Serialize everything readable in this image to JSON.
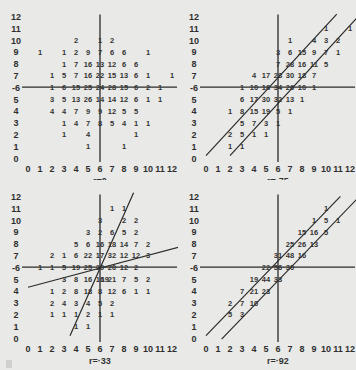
{
  "chart_data": [
    {
      "type": "table",
      "title": "r=0",
      "r_label": "r=0",
      "x_ticks": [
        0,
        1,
        2,
        3,
        4,
        5,
        6,
        7,
        8,
        9,
        10,
        11,
        12
      ],
      "y_ticks": [
        0,
        1,
        2,
        3,
        4,
        5,
        6,
        7,
        8,
        9,
        10,
        11,
        12
      ],
      "axis_cross": [
        6,
        6
      ],
      "regression_lines": [],
      "cells": [
        [
          10,
          4,
          2
        ],
        [
          10,
          6,
          1
        ],
        [
          10,
          7,
          2
        ],
        [
          9,
          1,
          1
        ],
        [
          9,
          3,
          1
        ],
        [
          9,
          4,
          2
        ],
        [
          9,
          5,
          9
        ],
        [
          9,
          6,
          7
        ],
        [
          9,
          7,
          6
        ],
        [
          9,
          8,
          6
        ],
        [
          9,
          10,
          1
        ],
        [
          8,
          3,
          1
        ],
        [
          8,
          4,
          7
        ],
        [
          8,
          5,
          16
        ],
        [
          8,
          6,
          13
        ],
        [
          8,
          7,
          12
        ],
        [
          8,
          8,
          6
        ],
        [
          8,
          9,
          6
        ],
        [
          7,
          2,
          1
        ],
        [
          7,
          3,
          5
        ],
        [
          7,
          4,
          7
        ],
        [
          7,
          5,
          16
        ],
        [
          7,
          6,
          22
        ],
        [
          7,
          7,
          15
        ],
        [
          7,
          8,
          13
        ],
        [
          7,
          9,
          6
        ],
        [
          7,
          10,
          1
        ],
        [
          7,
          12,
          1
        ],
        [
          6,
          2,
          1
        ],
        [
          6,
          3,
          6
        ],
        [
          6,
          4,
          15
        ],
        [
          6,
          5,
          25
        ],
        [
          6,
          6,
          24
        ],
        [
          6,
          7,
          28
        ],
        [
          6,
          8,
          15
        ],
        [
          6,
          9,
          6
        ],
        [
          6,
          10,
          2
        ],
        [
          6,
          11,
          1
        ],
        [
          5,
          2,
          3
        ],
        [
          5,
          3,
          5
        ],
        [
          5,
          4,
          13
        ],
        [
          5,
          5,
          26
        ],
        [
          5,
          6,
          14
        ],
        [
          5,
          7,
          14
        ],
        [
          5,
          8,
          12
        ],
        [
          5,
          9,
          6
        ],
        [
          5,
          10,
          1
        ],
        [
          5,
          11,
          1
        ],
        [
          4,
          2,
          4
        ],
        [
          4,
          3,
          4
        ],
        [
          4,
          4,
          7
        ],
        [
          4,
          5,
          9
        ],
        [
          4,
          6,
          9
        ],
        [
          4,
          7,
          12
        ],
        [
          4,
          8,
          5
        ],
        [
          4,
          9,
          5
        ],
        [
          3,
          3,
          1
        ],
        [
          3,
          4,
          4
        ],
        [
          3,
          5,
          7
        ],
        [
          3,
          6,
          8
        ],
        [
          3,
          7,
          5
        ],
        [
          3,
          8,
          4
        ],
        [
          3,
          9,
          1
        ],
        [
          3,
          10,
          1
        ],
        [
          2,
          3,
          1
        ],
        [
          2,
          5,
          4
        ],
        [
          2,
          9,
          1
        ],
        [
          1,
          5,
          1
        ],
        [
          1,
          8,
          1
        ]
      ]
    },
    {
      "type": "table",
      "title": "r=·75",
      "r_label": "r=·75",
      "x_ticks": [
        0,
        1,
        2,
        3,
        4,
        5,
        6,
        7,
        8,
        9,
        10,
        11,
        12
      ],
      "y_ticks": [
        0,
        1,
        2,
        3,
        4,
        5,
        6,
        7,
        8,
        9,
        10,
        11,
        12
      ],
      "axis_cross": [
        6,
        6
      ],
      "regression_lines": [
        [
          [
            0,
            0.2
          ],
          [
            10.9,
            12.2
          ]
        ],
        [
          [
            2,
            0.2
          ],
          [
            12.6,
            11.9
          ]
        ]
      ],
      "cells": [
        [
          11,
          10,
          1
        ],
        [
          11,
          12,
          1
        ],
        [
          10,
          7,
          1
        ],
        [
          10,
          9,
          4
        ],
        [
          10,
          10,
          3
        ],
        [
          10,
          11,
          2
        ],
        [
          9,
          6,
          3
        ],
        [
          9,
          7,
          6
        ],
        [
          9,
          8,
          15
        ],
        [
          9,
          9,
          9
        ],
        [
          9,
          10,
          7
        ],
        [
          9,
          11,
          1
        ],
        [
          8,
          6,
          7
        ],
        [
          8,
          7,
          28
        ],
        [
          8,
          8,
          16
        ],
        [
          8,
          9,
          11
        ],
        [
          8,
          10,
          5
        ],
        [
          7,
          4,
          4
        ],
        [
          7,
          5,
          17
        ],
        [
          7,
          6,
          28
        ],
        [
          7,
          7,
          30
        ],
        [
          7,
          8,
          18
        ],
        [
          7,
          9,
          7
        ],
        [
          6,
          3,
          1
        ],
        [
          6,
          4,
          10
        ],
        [
          6,
          5,
          18
        ],
        [
          6,
          6,
          34
        ],
        [
          6,
          7,
          26
        ],
        [
          6,
          8,
          10
        ],
        [
          6,
          9,
          1
        ],
        [
          5,
          3,
          6
        ],
        [
          5,
          4,
          17
        ],
        [
          5,
          5,
          30
        ],
        [
          5,
          6,
          32
        ],
        [
          5,
          7,
          13
        ],
        [
          5,
          8,
          1
        ],
        [
          4,
          2,
          1
        ],
        [
          4,
          3,
          8
        ],
        [
          4,
          4,
          15
        ],
        [
          4,
          5,
          19
        ],
        [
          4,
          6,
          5
        ],
        [
          4,
          7,
          1
        ],
        [
          3,
          3,
          5
        ],
        [
          3,
          4,
          7
        ],
        [
          3,
          5,
          3
        ],
        [
          3,
          6,
          1
        ],
        [
          2,
          2,
          2
        ],
        [
          2,
          3,
          5
        ],
        [
          2,
          4,
          1
        ],
        [
          2,
          5,
          1
        ],
        [
          1,
          2,
          1
        ],
        [
          1,
          3,
          1
        ]
      ]
    },
    {
      "type": "table",
      "title": "r=·33",
      "r_label": "r=·33",
      "x_ticks": [
        0,
        1,
        2,
        3,
        4,
        5,
        6,
        7,
        8,
        9,
        10,
        11,
        12
      ],
      "y_ticks": [
        0,
        1,
        2,
        3,
        4,
        5,
        6,
        7,
        8,
        9,
        10,
        11,
        12
      ],
      "axis_cross": [
        6,
        6
      ],
      "regression_lines": [
        [
          [
            3.5,
            0.2
          ],
          [
            8.8,
            12.3
          ]
        ],
        [
          [
            0,
            4.3
          ],
          [
            12.6,
            7.7
          ]
        ]
      ],
      "cells": [
        [
          11,
          7,
          1
        ],
        [
          11,
          8,
          1
        ],
        [
          10,
          6,
          3
        ],
        [
          10,
          8,
          2
        ],
        [
          10,
          9,
          2
        ],
        [
          9,
          5,
          3
        ],
        [
          9,
          6,
          2
        ],
        [
          9,
          7,
          6
        ],
        [
          9,
          8,
          5
        ],
        [
          9,
          9,
          2
        ],
        [
          8,
          4,
          5
        ],
        [
          8,
          5,
          6
        ],
        [
          8,
          6,
          16
        ],
        [
          8,
          7,
          18
        ],
        [
          8,
          8,
          14
        ],
        [
          8,
          9,
          7
        ],
        [
          8,
          10,
          2
        ],
        [
          7,
          2,
          2
        ],
        [
          7,
          3,
          1
        ],
        [
          7,
          4,
          6
        ],
        [
          7,
          5,
          22
        ],
        [
          7,
          6,
          17
        ],
        [
          7,
          7,
          32
        ],
        [
          7,
          8,
          12
        ],
        [
          7,
          9,
          12
        ],
        [
          7,
          10,
          3
        ],
        [
          6,
          1,
          1
        ],
        [
          6,
          2,
          1
        ],
        [
          6,
          3,
          5
        ],
        [
          6,
          4,
          19
        ],
        [
          6,
          5,
          25
        ],
        [
          6,
          6,
          29
        ],
        [
          6,
          7,
          20
        ],
        [
          6,
          8,
          12
        ],
        [
          6,
          9,
          2
        ],
        [
          5,
          3,
          3
        ],
        [
          5,
          4,
          8
        ],
        [
          5,
          5,
          16
        ],
        [
          5,
          6,
          16
        ],
        [
          5,
          6.4,
          19
        ],
        [
          5,
          7,
          21
        ],
        [
          5,
          8,
          7
        ],
        [
          5,
          9,
          5
        ],
        [
          5,
          10,
          2
        ],
        [
          4,
          2,
          1
        ],
        [
          4,
          3,
          2
        ],
        [
          4,
          4,
          8
        ],
        [
          4,
          5,
          18
        ],
        [
          4,
          6,
          8
        ],
        [
          4,
          7,
          12
        ],
        [
          4,
          8,
          6
        ],
        [
          4,
          9,
          1
        ],
        [
          4,
          10,
          1
        ],
        [
          3,
          2,
          2
        ],
        [
          3,
          3,
          4
        ],
        [
          3,
          4,
          3
        ],
        [
          3,
          5,
          4
        ],
        [
          3,
          6,
          5
        ],
        [
          3,
          7,
          2
        ],
        [
          2,
          2,
          1
        ],
        [
          2,
          3,
          1
        ],
        [
          2,
          4,
          1
        ],
        [
          2,
          5,
          2
        ],
        [
          2,
          6,
          1
        ],
        [
          2,
          7,
          1
        ],
        [
          1,
          4,
          1
        ],
        [
          1,
          5,
          1
        ]
      ]
    },
    {
      "type": "table",
      "title": "r=·92",
      "r_label": "r=·92",
      "x_ticks": [
        0,
        1,
        2,
        3,
        4,
        5,
        6,
        7,
        8,
        9,
        10,
        11,
        12
      ],
      "y_ticks": [
        0,
        1,
        2,
        3,
        4,
        5,
        6,
        7,
        8,
        9,
        10,
        11,
        12
      ],
      "axis_cross": [
        6,
        6
      ],
      "regression_lines": [
        [
          [
            0,
            0.2
          ],
          [
            11.2,
            12
          ]
        ],
        [
          [
            1.3,
            -0.1
          ],
          [
            12.6,
            11.8
          ]
        ]
      ],
      "cells": [
        [
          11,
          10,
          1
        ],
        [
          10,
          9,
          1
        ],
        [
          10,
          10,
          5
        ],
        [
          10,
          11,
          1
        ],
        [
          9,
          8,
          15
        ],
        [
          9,
          9,
          16
        ],
        [
          9,
          10,
          5
        ],
        [
          8,
          7,
          25
        ],
        [
          8,
          8,
          26
        ],
        [
          8,
          9,
          13
        ],
        [
          7,
          6,
          31
        ],
        [
          7,
          7,
          48
        ],
        [
          7,
          8,
          16
        ],
        [
          6,
          5,
          22
        ],
        [
          6,
          6,
          56
        ],
        [
          6,
          7,
          30
        ],
        [
          5,
          4,
          19
        ],
        [
          5,
          5,
          44
        ],
        [
          5,
          6,
          33
        ],
        [
          4,
          3,
          7
        ],
        [
          4,
          4,
          21
        ],
        [
          4,
          5,
          23
        ],
        [
          3,
          2,
          2
        ],
        [
          3,
          3,
          7
        ],
        [
          3,
          4,
          10
        ],
        [
          2,
          2,
          5
        ],
        [
          2,
          3,
          3
        ]
      ]
    }
  ],
  "panels": [
    {
      "r_label": "r=0"
    },
    {
      "r_label": "r=·75"
    },
    {
      "r_label": "r=·33"
    },
    {
      "r_label": "r=·92"
    }
  ]
}
